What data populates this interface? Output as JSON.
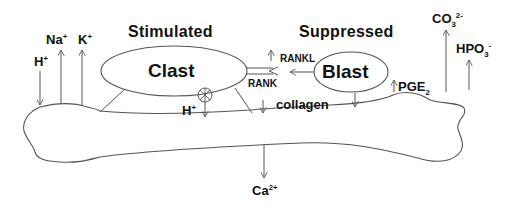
{
  "diagram": {
    "titles": {
      "stimulated": "Stimulated",
      "suppressed": "Suppressed"
    },
    "cells": {
      "clast": "Clast",
      "blast": "Blast"
    },
    "ions": {
      "h_left": "H",
      "h_left_charge": "+",
      "na": "Na",
      "na_charge": "+",
      "k": "K",
      "k_charge": "+",
      "h_pump": "H",
      "h_pump_charge": "+",
      "ca": "Ca",
      "ca_charge": "2+",
      "co3": "CO",
      "co3_sub": "3",
      "co3_charge": "2-",
      "hpo3": "HPO",
      "hpo3_sub": "3",
      "hpo3_charge": "-"
    },
    "signals": {
      "rankl": "RANKL",
      "rank": "RANK",
      "pge": "PGE",
      "pge_sub": "2",
      "collagen": "collagen"
    },
    "colors": {
      "stroke": "#555555",
      "text": "#111111",
      "background": "#ffffff"
    }
  }
}
